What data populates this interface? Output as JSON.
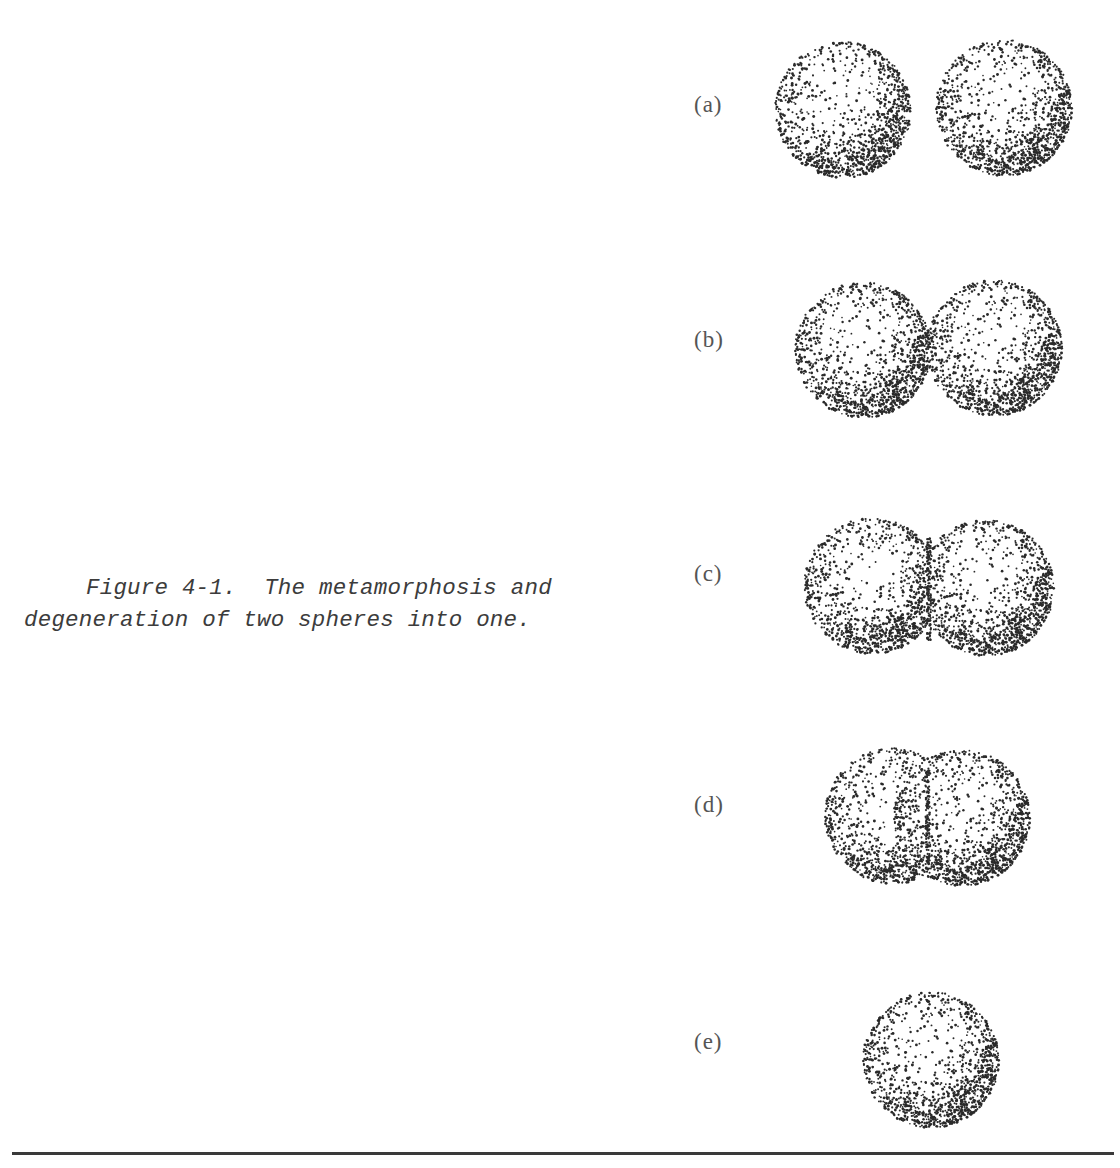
{
  "figure": {
    "number": "Figure 4-1.",
    "caption_line1": "Figure 4-1.  The metamorphosis and",
    "caption_line2": "degeneration of two spheres into one.",
    "caption_full": "Figure 4-1. The metamorphosis and degeneration of two spheres into one."
  },
  "panels": [
    {
      "label": "(a)",
      "stage": "two separate spheres",
      "label_y": 108,
      "spheres": [
        {
          "cx": 843,
          "cy": 110,
          "r": 68
        },
        {
          "cx": 1004,
          "cy": 108,
          "r": 68
        }
      ]
    },
    {
      "label": "(b)",
      "stage": "two spheres touching",
      "label_y": 343,
      "spheres": [
        {
          "cx": 863,
          "cy": 350,
          "r": 68
        },
        {
          "cx": 994,
          "cy": 348,
          "r": 68
        }
      ]
    },
    {
      "label": "(c)",
      "stage": "two spheres slightly merged",
      "label_y": 577,
      "spheres": [
        {
          "cx": 872,
          "cy": 586,
          "r": 68
        },
        {
          "cx": 986,
          "cy": 588,
          "r": 68
        }
      ]
    },
    {
      "label": "(d)",
      "stage": "two spheres largely merged",
      "label_y": 808,
      "spheres": [
        {
          "cx": 893,
          "cy": 816,
          "r": 68
        },
        {
          "cx": 962,
          "cy": 818,
          "r": 68
        }
      ]
    },
    {
      "label": "(e)",
      "stage": "single sphere",
      "label_y": 1045,
      "spheres": [
        {
          "cx": 931,
          "cy": 1060,
          "r": 68
        }
      ]
    }
  ],
  "colors": {
    "ink": "#2a2a2a",
    "text": "#3c3c3c",
    "paper": "#ffffff"
  }
}
